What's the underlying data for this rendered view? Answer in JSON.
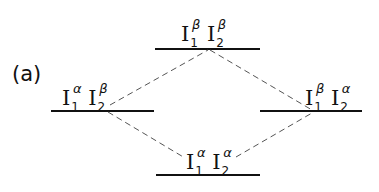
{
  "panel_label": "(a)",
  "levels": {
    "top": {
      "base": "I",
      "s1": "1",
      "g1": "β",
      "s2": "2",
      "g2": "β"
    },
    "left": {
      "base": "I",
      "s1": "1",
      "g1": "α",
      "s2": "2",
      "g2": "β"
    },
    "right": {
      "base": "I",
      "s1": "1",
      "g1": "β",
      "s2": "2",
      "g2": "α"
    },
    "bottom": {
      "base": "I",
      "s1": "1",
      "g1": "α",
      "s2": "2",
      "g2": "α"
    }
  },
  "colors": {
    "line": "#111111",
    "dash": "#555555"
  }
}
